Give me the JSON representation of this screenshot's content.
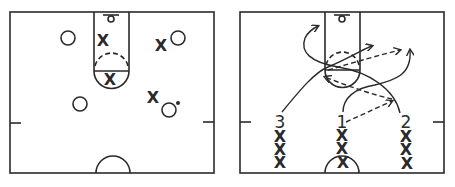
{
  "figure": {
    "colors": {
      "ink": "#2a2a2a",
      "background": "#ffffff"
    }
  },
  "diagram_left": {
    "title": "Defensive positioning",
    "offense_symbol": "O",
    "defense_symbol": "X",
    "offense_players": [
      {
        "x": 68,
        "y": 38
      },
      {
        "x": 178,
        "y": 38
      },
      {
        "x": 80,
        "y": 104
      },
      {
        "x": 170,
        "y": 110,
        "has_ball": true
      }
    ],
    "defense_players": [
      {
        "x": 103,
        "y": 40,
        "label": "X"
      },
      {
        "x": 161,
        "y": 45,
        "label": "X"
      },
      {
        "x": 110,
        "y": 79,
        "label": "X"
      },
      {
        "x": 153,
        "y": 97,
        "label": "X"
      }
    ]
  },
  "diagram_right": {
    "title": "Three-line weave drill",
    "lines": [
      {
        "number": "3",
        "x": 278,
        "marks": [
          "X",
          "X",
          "X"
        ]
      },
      {
        "number": "1",
        "x": 342,
        "marks": [
          "X",
          "X",
          "X"
        ]
      },
      {
        "number": "2",
        "x": 406,
        "marks": [
          "X",
          "X",
          "X"
        ]
      }
    ],
    "cut_paths": "solid curved arrows",
    "pass_paths": "dashed arrows"
  }
}
